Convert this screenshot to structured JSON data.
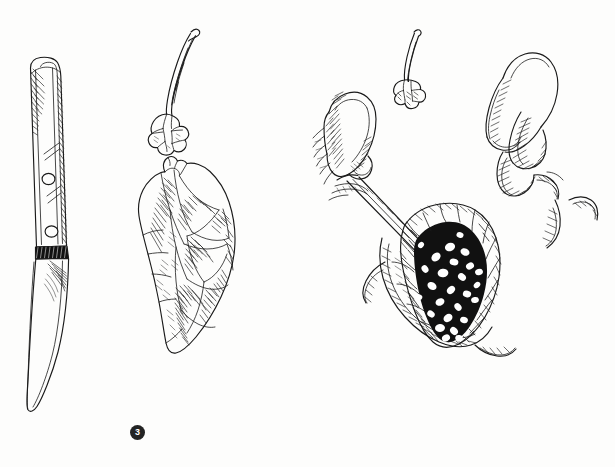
{
  "plate": {
    "title": "Cookbook step illustration plate",
    "medium": "pen-and-ink line drawing",
    "background_color": "#fdfdfc",
    "ink_color": "#1a1a1a",
    "badge_color": "#232323",
    "badge_text_color": "#ffffff"
  },
  "panels": [
    {
      "number": "3",
      "name": "panel-left",
      "badge_label": "3",
      "subjects": [
        {
          "name": "paring-knife",
          "label": "paring knife with riveted handle"
        },
        {
          "name": "garlic-sprout",
          "label": "sprouted garlic clove with shoot"
        },
        {
          "name": "cabbage-leaf",
          "label": "crumpled cabbage leaf"
        }
      ]
    },
    {
      "number": "4",
      "name": "panel-right",
      "badge_label": "4",
      "subjects": [
        {
          "name": "left-hand-holding-knife",
          "label": "hand holding knife blade"
        },
        {
          "name": "garlic-sprout-small",
          "label": "small sprouted garlic clove"
        },
        {
          "name": "right-hand-fingers",
          "label": "fingers cradling the leaf"
        },
        {
          "name": "stuffed-leaf",
          "label": "dark stuffed leaf with rice grains"
        }
      ]
    }
  ],
  "badges": {
    "three": "3",
    "four": "4"
  }
}
